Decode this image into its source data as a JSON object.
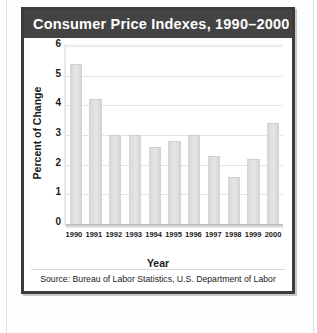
{
  "figure": {
    "title": "Consumer Price Indexes, 1990–2000",
    "source": "Source: Bureau of Labor Statistics, U.S. Department of Labor",
    "colors": {
      "frame": "#3c3c3c",
      "header_background": "#434343",
      "header_text": "#ffffff",
      "panel_background": "#ffffff",
      "bar_fill": "#dcdcdc",
      "gridline": "#e4e4e4",
      "axis_text": "#1a1a1a"
    }
  },
  "chart_data": {
    "type": "bar",
    "title": "Consumer Price Indexes, 1990–2000",
    "xlabel": "Year",
    "ylabel": "Percent of Change",
    "categories": [
      "1990",
      "1991",
      "1992",
      "1993",
      "1994",
      "1995",
      "1996",
      "1997",
      "1998",
      "1999",
      "2000"
    ],
    "values": [
      5.4,
      4.2,
      3.0,
      3.0,
      2.6,
      2.8,
      3.0,
      2.3,
      1.6,
      2.2,
      3.4
    ],
    "ylim": [
      0,
      6
    ],
    "yticks": [
      "0",
      "1",
      "2",
      "3",
      "4",
      "5",
      "6"
    ],
    "ytick_values": [
      0,
      1,
      2,
      3,
      4,
      5,
      6
    ],
    "grid": true,
    "legend": "none",
    "series": [
      {
        "name": "Percent of Change",
        "values": [
          5.4,
          4.2,
          3.0,
          3.0,
          2.6,
          2.8,
          3.0,
          2.3,
          1.6,
          2.2,
          3.4
        ]
      }
    ]
  }
}
